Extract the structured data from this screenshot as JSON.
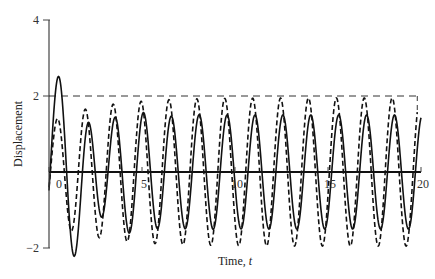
{
  "chart_data": {
    "type": "line",
    "title": "",
    "xlabel": "Time, t",
    "xlabel_main": "Time, ",
    "xlabel_var": "t",
    "ylabel": "Displacement",
    "xlim": [
      0,
      20
    ],
    "ylim": [
      -2,
      4
    ],
    "x_ticks": [
      0,
      5,
      10,
      15,
      20
    ],
    "x_tick_labels": [
      "0",
      "5",
      "10",
      "15",
      "20"
    ],
    "y_ticks": [
      -2,
      2,
      4
    ],
    "y_tick_labels": [
      "−2",
      "2",
      "4"
    ],
    "grid": false,
    "legend": null,
    "reference_lines": [
      {
        "name": "amplitude-bound",
        "y": 2,
        "style": "dashed",
        "x_range": [
          0,
          20
        ]
      }
    ],
    "series": [
      {
        "name": "response (solid)",
        "style": "solid",
        "key_points": [
          {
            "t": 0.0,
            "y": 0.0
          },
          {
            "t": 0.5,
            "y": 0.6
          },
          {
            "t": 1.3,
            "y": -1.45
          },
          {
            "t": 2.35,
            "y": 2.1
          },
          {
            "t": 3.0,
            "y": -0.3
          },
          {
            "t": 3.5,
            "y": 0.95
          },
          {
            "t": 4.4,
            "y": -1.45
          },
          {
            "t": 5.2,
            "y": 1.85
          },
          {
            "t": 20.0,
            "y": 0.0
          }
        ],
        "steady_state_amplitude": 1.5,
        "period": 1.5
      },
      {
        "name": "response (dashed)",
        "style": "dashed",
        "key_points": [
          {
            "t": 0.0,
            "y": 0.0
          },
          {
            "t": 1.95,
            "y": 1.5
          },
          {
            "t": 2.7,
            "y": -1.6
          },
          {
            "t": 3.45,
            "y": 1.7
          },
          {
            "t": 4.15,
            "y": -1.8
          },
          {
            "t": 4.9,
            "y": 1.85
          },
          {
            "t": 19.8,
            "y": 1.95
          }
        ],
        "steady_state_amplitude": 1.95,
        "period": 1.5
      }
    ]
  },
  "plot": {
    "x0_px": 49,
    "x1_px": 421,
    "y0_val_px": 172,
    "px_per_y": 38
  }
}
